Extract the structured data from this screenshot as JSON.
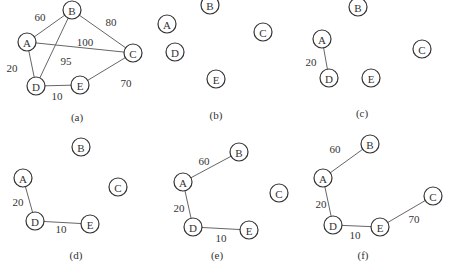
{
  "figure": {
    "panels": [
      {
        "id": "a",
        "caption": "(a)",
        "caption_pos": [
          77,
          117
        ],
        "nodes": [
          {
            "label": "A",
            "x": 27,
            "y": 42
          },
          {
            "label": "B",
            "x": 72,
            "y": 10
          },
          {
            "label": "C",
            "x": 133,
            "y": 53
          },
          {
            "label": "D",
            "x": 36,
            "y": 86
          },
          {
            "label": "E",
            "x": 80,
            "y": 85
          }
        ],
        "edges": [
          {
            "from": "A",
            "to": "B",
            "weight": "60",
            "lx": 40,
            "ly": 17
          },
          {
            "from": "B",
            "to": "C",
            "weight": "80",
            "lx": 111,
            "ly": 22
          },
          {
            "from": "A",
            "to": "C",
            "weight": "100",
            "lx": 85,
            "ly": 42
          },
          {
            "from": "B",
            "to": "D",
            "weight": "95",
            "lx": 66,
            "ly": 61
          },
          {
            "from": "A",
            "to": "D",
            "weight": "20",
            "lx": 12,
            "ly": 68
          },
          {
            "from": "D",
            "to": "E",
            "weight": "10",
            "lx": 57,
            "ly": 96
          },
          {
            "from": "E",
            "to": "C",
            "weight": "70",
            "lx": 126,
            "ly": 83
          }
        ]
      },
      {
        "id": "b",
        "caption": "(b)",
        "caption_pos": [
          216,
          115
        ],
        "nodes": [
          {
            "label": "A",
            "x": 167,
            "y": 24
          },
          {
            "label": "B",
            "x": 210,
            "y": 5
          },
          {
            "label": "C",
            "x": 263,
            "y": 32
          },
          {
            "label": "D",
            "x": 175,
            "y": 52
          },
          {
            "label": "E",
            "x": 216,
            "y": 79
          }
        ],
        "edges": []
      },
      {
        "id": "c",
        "caption": "(c)",
        "caption_pos": [
          362,
          113
        ],
        "nodes": [
          {
            "label": "A",
            "x": 322,
            "y": 39
          },
          {
            "label": "B",
            "x": 358,
            "y": 7
          },
          {
            "label": "C",
            "x": 422,
            "y": 49
          },
          {
            "label": "D",
            "x": 329,
            "y": 78
          },
          {
            "label": "E",
            "x": 371,
            "y": 78
          }
        ],
        "edges": [
          {
            "from": "A",
            "to": "D",
            "weight": "20",
            "lx": 311,
            "ly": 62
          }
        ]
      },
      {
        "id": "d",
        "caption": "(d)",
        "caption_pos": [
          76,
          255
        ],
        "nodes": [
          {
            "label": "A",
            "x": 23,
            "y": 178
          },
          {
            "label": "B",
            "x": 81,
            "y": 147
          },
          {
            "label": "C",
            "x": 118,
            "y": 187
          },
          {
            "label": "D",
            "x": 35,
            "y": 221
          },
          {
            "label": "E",
            "x": 90,
            "y": 224
          }
        ],
        "edges": [
          {
            "from": "A",
            "to": "D",
            "weight": "20",
            "lx": 18,
            "ly": 202
          },
          {
            "from": "D",
            "to": "E",
            "weight": "10",
            "lx": 61,
            "ly": 229
          }
        ]
      },
      {
        "id": "e",
        "caption": "(e)",
        "caption_pos": [
          217,
          255
        ],
        "nodes": [
          {
            "label": "A",
            "x": 183,
            "y": 182
          },
          {
            "label": "B",
            "x": 239,
            "y": 152
          },
          {
            "label": "C",
            "x": 279,
            "y": 193
          },
          {
            "label": "D",
            "x": 193,
            "y": 227
          },
          {
            "label": "E",
            "x": 249,
            "y": 230
          }
        ],
        "edges": [
          {
            "from": "A",
            "to": "B",
            "weight": "60",
            "lx": 204,
            "ly": 161
          },
          {
            "from": "A",
            "to": "D",
            "weight": "20",
            "lx": 179,
            "ly": 208
          },
          {
            "from": "D",
            "to": "E",
            "weight": "10",
            "lx": 221,
            "ly": 238
          }
        ]
      },
      {
        "id": "f",
        "caption": "(f)",
        "caption_pos": [
          363,
          255
        ],
        "nodes": [
          {
            "label": "A",
            "x": 323,
            "y": 178
          },
          {
            "label": "B",
            "x": 370,
            "y": 144
          },
          {
            "label": "C",
            "x": 433,
            "y": 196
          },
          {
            "label": "D",
            "x": 333,
            "y": 225
          },
          {
            "label": "E",
            "x": 380,
            "y": 227
          }
        ],
        "edges": [
          {
            "from": "A",
            "to": "B",
            "weight": "60",
            "lx": 335,
            "ly": 149
          },
          {
            "from": "A",
            "to": "D",
            "weight": "20",
            "lx": 321,
            "ly": 204
          },
          {
            "from": "D",
            "to": "E",
            "weight": "10",
            "lx": 355,
            "ly": 235
          },
          {
            "from": "E",
            "to": "C",
            "weight": "70",
            "lx": 414,
            "ly": 219
          }
        ]
      }
    ]
  }
}
